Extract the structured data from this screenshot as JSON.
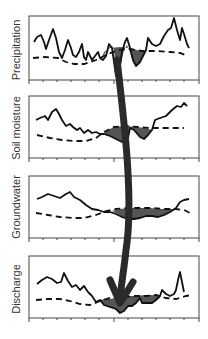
{
  "figure": {
    "type": "drought propagation diagram",
    "panels": [
      {
        "id": "precipitation",
        "label": "Precipitation"
      },
      {
        "id": "soil-moisture",
        "label": "Soil moisture"
      },
      {
        "id": "groundwater",
        "label": "Groundwater"
      },
      {
        "id": "discharge",
        "label": "Discharge"
      }
    ],
    "legend_semantics": {
      "solid_line": "observed variable",
      "dashed_line": "threshold",
      "shaded_area": "deficit / drought"
    },
    "arrow": "propagation from precipitation to discharge",
    "colors": {
      "line": "#111111",
      "shade": "#555555",
      "frame": "#444444",
      "arrow": "#2a2a2a",
      "label": "#333333"
    }
  }
}
